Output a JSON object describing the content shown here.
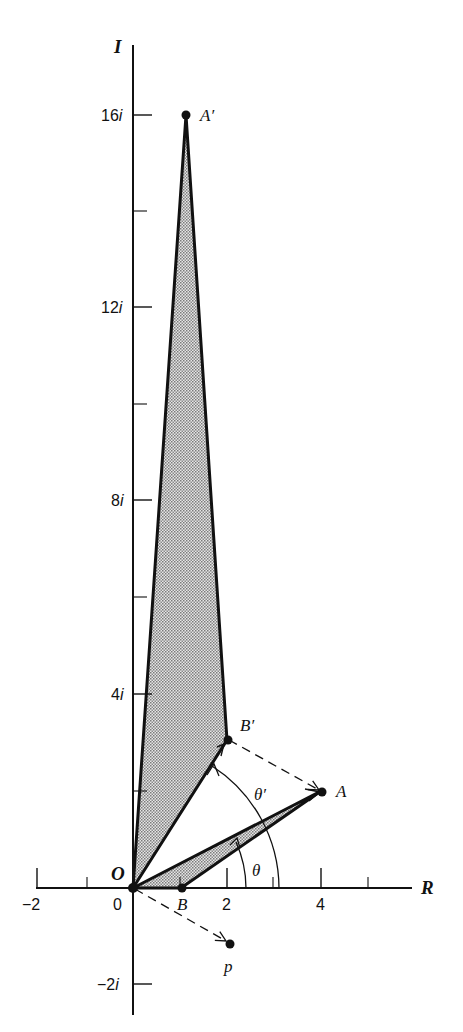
{
  "axes": {
    "x_label": "R",
    "y_label": "I",
    "x_ticks": [
      {
        "value": -2,
        "label": "−2"
      },
      {
        "value": 0,
        "label": "0"
      },
      {
        "value": 2,
        "label": "2"
      },
      {
        "value": 4,
        "label": "4"
      }
    ],
    "y_ticks": [
      {
        "value": 16,
        "label": "16",
        "suffix": "i"
      },
      {
        "value": 12,
        "label": "12",
        "suffix": "i"
      },
      {
        "value": 8,
        "label": "8",
        "suffix": "i"
      },
      {
        "value": 4,
        "label": "4",
        "suffix": "i"
      },
      {
        "value": -2,
        "label": "−2",
        "suffix": "i"
      }
    ]
  },
  "points": {
    "O": {
      "label": "O",
      "re": 0,
      "im": 0
    },
    "A": {
      "label": "A",
      "re": 4,
      "im": 2
    },
    "B": {
      "label": "B",
      "re": 1,
      "im": 0
    },
    "A_prime": {
      "label": "A′",
      "re": 1,
      "im": 16
    },
    "B_prime": {
      "label": "B′",
      "re": 2,
      "im": 3
    },
    "p": {
      "label": "p",
      "re": 2,
      "im": -1
    }
  },
  "angles": {
    "theta": "θ",
    "theta_prime": "θ′"
  },
  "colors": {
    "ink": "#111111",
    "fill_stipple": "#b9b9b9",
    "background": "#ffffff"
  }
}
